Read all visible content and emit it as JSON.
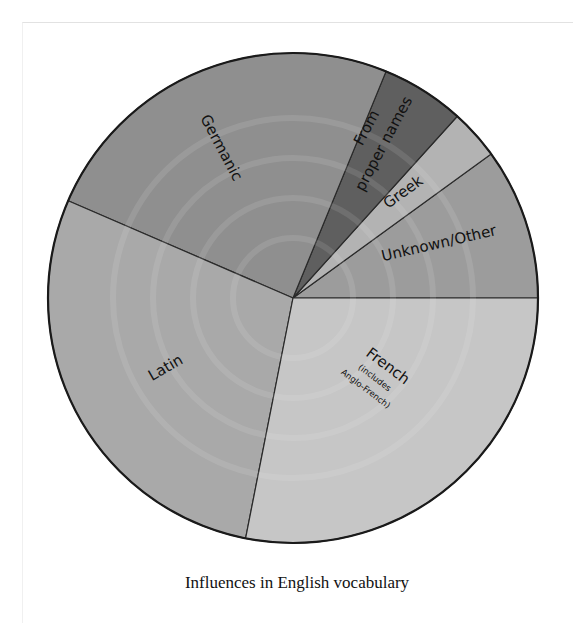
{
  "chart_data": {
    "type": "pie",
    "title": "Influences in English vocabulary",
    "start_angle_deg": 0,
    "direction": "counterclockwise",
    "slices": [
      {
        "name": "Unknown/Other",
        "value": 10,
        "color": "#9c9c9c"
      },
      {
        "name": "Greek",
        "value": 3.3,
        "color": "#b3b3b3"
      },
      {
        "name": "From proper names",
        "value": 5.5,
        "color": "#5f5f5f"
      },
      {
        "name": "Germanic",
        "value": 24.7,
        "color": "#8f8f8f"
      },
      {
        "name": "Latin",
        "value": 28.4,
        "color": "#a9a9a9"
      },
      {
        "name": "French (includes Anglo-French)",
        "value": 28.1,
        "color": "#c6c6c6"
      }
    ],
    "legend": "none (labels drawn on slices)"
  },
  "labels": {
    "germanic": "Germanic",
    "proper_line1": "From",
    "proper_line2": "proper names",
    "greek": "Greek",
    "unknown": "Unknown/Other",
    "latin": "Latin",
    "french": "French",
    "french_sub1": "(includes",
    "french_sub2": "Anglo-French)"
  },
  "caption": "Influences in English vocabulary"
}
